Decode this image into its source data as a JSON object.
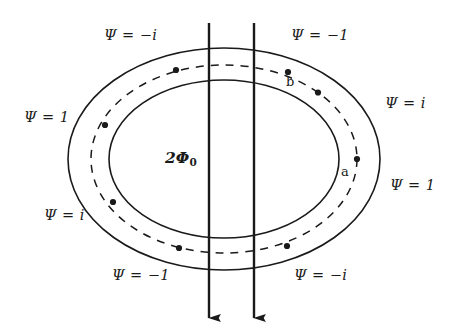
{
  "figure": {
    "type": "physics-diagram",
    "background_color": "#ffffff",
    "stroke_color": "#1a1a1a",
    "width": 456,
    "height": 334
  },
  "center": {
    "flux_label": "2Φ",
    "flux_subscript": "0",
    "flux_label_full": "2Φ0"
  },
  "points": [
    {
      "id": "a",
      "label": "a",
      "angle_deg": 0
    },
    {
      "id": "b",
      "label": "b",
      "angle_deg": 45
    }
  ],
  "psi_labels": [
    {
      "id": "top-left",
      "text": "Ψ = −i",
      "angle_deg": 135
    },
    {
      "id": "top-right",
      "text": "Ψ = −1",
      "angle_deg": 45
    },
    {
      "id": "left-upper",
      "text": "Ψ = 1",
      "angle_deg": 180
    },
    {
      "id": "right-upper",
      "text": "Ψ = i",
      "angle_deg": 25
    },
    {
      "id": "right-lower",
      "text": "Ψ = 1",
      "angle_deg": -20
    },
    {
      "id": "left-lower",
      "text": "Ψ = i",
      "angle_deg": -160
    },
    {
      "id": "bottom-left",
      "text": "Ψ = −1",
      "angle_deg": -135
    },
    {
      "id": "bottom-right",
      "text": "Ψ = −i",
      "angle_deg": -45
    }
  ],
  "flux_lines": [
    {
      "id": "flux-line-left",
      "x": 209,
      "y_start": 23,
      "y_end": 318,
      "direction": "down"
    },
    {
      "id": "flux-line-right",
      "x": 254,
      "y_start": 23,
      "y_end": 318,
      "direction": "down"
    }
  ],
  "ellipses": [
    {
      "id": "outer-ring",
      "cx": 224,
      "cy": 159,
      "rx": 156,
      "ry": 111,
      "style": "solid"
    },
    {
      "id": "path-ring",
      "cx": 224,
      "cy": 159,
      "rx": 133,
      "ry": 94,
      "style": "dashed"
    },
    {
      "id": "inner-ring",
      "cx": 224,
      "cy": 159,
      "rx": 115,
      "ry": 79,
      "style": "solid"
    }
  ],
  "path_dots": [
    {
      "id": "dot-a",
      "angle_deg": 0
    },
    {
      "id": "dot-b",
      "angle_deg": 45
    },
    {
      "id": "dot-2",
      "angle_deg": 90
    },
    {
      "id": "dot-3",
      "angle_deg": 135
    },
    {
      "id": "dot-4",
      "angle_deg": 180
    },
    {
      "id": "dot-5",
      "angle_deg": 225
    },
    {
      "id": "dot-6",
      "angle_deg": 270
    },
    {
      "id": "dot-7",
      "angle_deg": 315
    }
  ]
}
